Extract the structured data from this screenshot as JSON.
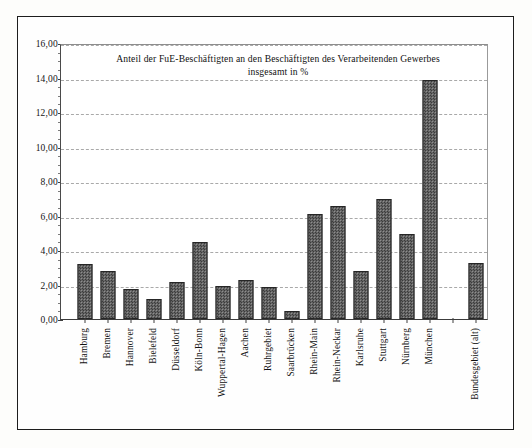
{
  "chart_data": {
    "type": "bar",
    "title": "Anteil der FuE-Beschäftigten an den Beschäftigten des Verarbeitenden Gewerbes insgesamt in %",
    "title_line1": "Anteil der FuE-Beschäftigten an den Beschäftigten des  Verarbeitenden Gewerbes",
    "title_line2": "insgesamt in %",
    "xlabel": "",
    "ylabel": "",
    "ylim": [
      0,
      16
    ],
    "ytick_step": 2,
    "grid": true,
    "legend": false,
    "categories": [
      "Hamburg",
      "Bremen",
      "Hannover",
      "Bielefeld",
      "Düsseldorf",
      "Köln-Bonn",
      "Wuppertal-Hagen",
      "Aachen",
      "Ruhrgebiet",
      "Saarbrücken",
      "Rhein-Main",
      "Rhein-Neckar",
      "Karlsruhe",
      "Stuttgart",
      "Nürnberg",
      "München",
      "Bundesgebiet (alt)"
    ],
    "values": [
      3.2,
      2.8,
      1.72,
      1.16,
      2.16,
      4.49,
      1.93,
      2.26,
      1.84,
      0.46,
      6.1,
      6.56,
      2.79,
      6.95,
      4.93,
      13.83,
      3.23
    ],
    "ytick_labels": [
      "0,00",
      "2,00",
      "4,00",
      "6,00",
      "8,00",
      "10,00",
      "12,00",
      "14,00",
      "16,00"
    ],
    "ytick_values": [
      0,
      2,
      4,
      6,
      8,
      10,
      12,
      14,
      16
    ],
    "gap_after_index": 15,
    "colors": {
      "bar_fill": "#5a5a5a",
      "bar_edge": "#262626",
      "gridline": "#a9a9a9",
      "axis": "#3f3f3f",
      "frame": "#1d1d1d",
      "text": "#111111",
      "background": "#ffffff"
    }
  }
}
